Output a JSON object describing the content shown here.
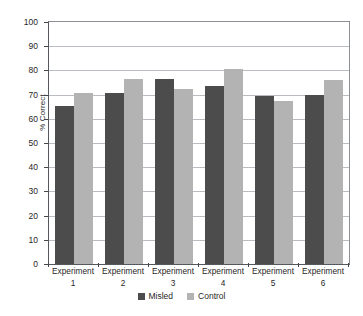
{
  "chart_data": {
    "type": "bar",
    "title": "",
    "xlabel": "",
    "ylabel": "% Correct",
    "ylim": [
      0,
      100
    ],
    "ytick_step": 10,
    "yticks": [
      "0",
      "10",
      "20",
      "30",
      "40",
      "50",
      "60",
      "70",
      "80",
      "90",
      "100"
    ],
    "grid": true,
    "legend_position": "bottom-center",
    "categories": [
      "Experiment 1",
      "Experiment 2",
      "Experiment 3",
      "Experiment 4",
      "Experiment 5",
      "Experiment 6"
    ],
    "category_lines": [
      {
        "line1": "Experiment",
        "line2": "1"
      },
      {
        "line1": "Experiment",
        "line2": "2"
      },
      {
        "line1": "Experiment",
        "line2": "3"
      },
      {
        "line1": "Experiment",
        "line2": "4"
      },
      {
        "line1": "Experiment",
        "line2": "5"
      },
      {
        "line1": "Experiment",
        "line2": "6"
      }
    ],
    "series": [
      {
        "name": "Misled",
        "color": "#4c4c4c",
        "values": [
          65.5,
          70.5,
          76.5,
          73.5,
          69.5,
          70.0
        ]
      },
      {
        "name": "Control",
        "color": "#b3b3b3",
        "values": [
          70.5,
          76.5,
          72.5,
          80.5,
          67.5,
          76.0
        ]
      }
    ]
  },
  "colors": {
    "misled": "#4c4c4c",
    "control": "#b3b3b3",
    "gridline": "#b9bcc0",
    "axis": "#55585c",
    "text": "#1f1f1f",
    "background": "#ffffff"
  }
}
